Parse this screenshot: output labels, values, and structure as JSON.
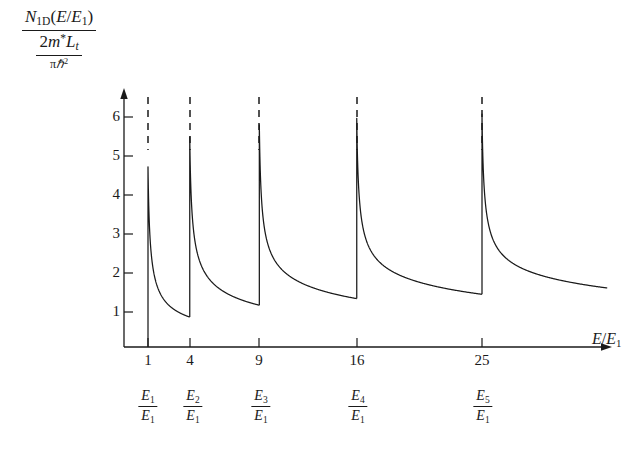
{
  "figure": {
    "title": "",
    "background": "#ffffff",
    "line_color": "#1a1a1a",
    "axis_color": "#1a1a1a",
    "dash_color": "#1a1a1a"
  },
  "axes": {
    "y_axis_label": {
      "numerator": {
        "symbol": "N",
        "subscript": "1D",
        "argument": "(E/E1)",
        "display": "N1D(E/E1)"
      },
      "denominator": {
        "display": "2m*Lt / πħ²",
        "num_text": "2m*Lt",
        "den_text": "πħ²",
        "coef": "2",
        "mass": "m",
        "star": "*",
        "length": "L",
        "length_sub": "t",
        "pi": "π",
        "hbar": "ħ",
        "hbar_pow": "2"
      }
    },
    "x_axis_label": {
      "numerator": "E",
      "denominator": "E",
      "denominator_sub": "1",
      "display": "E/E1"
    },
    "y_ticks": [
      "1",
      "2",
      "3",
      "4",
      "5",
      "6"
    ],
    "x_ticks": [
      "1",
      "4",
      "9",
      "16",
      "25"
    ],
    "x_subband_labels": [
      {
        "num": "E",
        "num_sub": "1",
        "den": "E",
        "den_sub": "1",
        "display": "E1/E1"
      },
      {
        "num": "E",
        "num_sub": "2",
        "den": "E",
        "den_sub": "1",
        "display": "E2/E1"
      },
      {
        "num": "E",
        "num_sub": "3",
        "den": "E",
        "den_sub": "1",
        "display": "E3/E1"
      },
      {
        "num": "E",
        "num_sub": "4",
        "den": "E",
        "den_sub": "1",
        "display": "E4/E1"
      },
      {
        "num": "E",
        "num_sub": "5",
        "den": "E",
        "den_sub": "1",
        "display": "E5/E1"
      }
    ]
  },
  "chart_data": {
    "type": "line",
    "title": "",
    "xlabel": "E/E1",
    "ylabel": "N1D(E/E1) / (2m*Lt/πħ²)",
    "xlim": [
      0,
      34
    ],
    "ylim": [
      0,
      7.0
    ],
    "xticks": [
      1,
      4,
      9,
      16,
      25
    ],
    "yticks": [
      1,
      2,
      3,
      4,
      5,
      6
    ],
    "grid": false,
    "legend": null,
    "subband_edges": [
      1,
      4,
      9,
      16,
      25
    ],
    "peak_value": 5.15,
    "formula": "sum over n of 1/sqrt(E/E1 - n^2 + 1) scaled",
    "series": [
      {
        "name": "n=1",
        "edge": 1,
        "x_start": 1,
        "x_end": 4,
        "y_at_edge": 5.15,
        "y_at_end": 0.6
      },
      {
        "name": "n=2",
        "edge": 4,
        "x_start": 4,
        "x_end": 9,
        "y_at_edge": 5.15,
        "y_at_end": 0.52
      },
      {
        "name": "n=3",
        "edge": 9,
        "x_start": 9,
        "x_end": 16,
        "y_at_edge": 5.15,
        "y_at_end": 0.5
      },
      {
        "name": "n=4",
        "edge": 16,
        "x_start": 16,
        "x_end": 25,
        "y_at_edge": 5.15,
        "y_at_end": 0.48
      },
      {
        "name": "n=5",
        "edge": 25,
        "x_start": 25,
        "x_end": 34,
        "y_at_edge": 5.15,
        "y_at_end": 0.52
      }
    ],
    "dashed_guides": {
      "x_positions": [
        1,
        4,
        9,
        16,
        25
      ],
      "y_top": 6.9,
      "y_bottom": 5.4,
      "style": "dashed"
    }
  }
}
